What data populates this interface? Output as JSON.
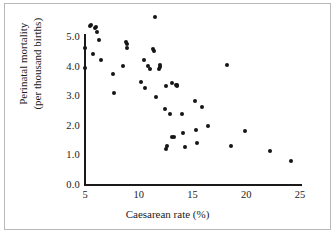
{
  "chart_data": {
    "type": "scatter",
    "title": "",
    "xlabel": "Caesarean rate (%)",
    "ylabel": "Perinatal mortality\n(per thousand births)",
    "ylabel_line1": "Perinatal mortality",
    "ylabel_line2": "(per thousand births)",
    "xlim": [
      5,
      25
    ],
    "ylim": [
      0.0,
      5.6
    ],
    "grid": false,
    "legend": null,
    "xticks": [
      5,
      10,
      15,
      20,
      25
    ],
    "xtick_labels": [
      "5",
      "10",
      "15",
      "20",
      "25"
    ],
    "yticks": [
      0.0,
      1.0,
      2.0,
      3.0,
      4.0,
      5.0
    ],
    "ytick_labels": [
      "0.0",
      "1.0",
      "2.0",
      "3.0",
      "4.0",
      "5.0"
    ],
    "marker_color": "#151515",
    "axis_color": "#1a1a1a",
    "background_color": "#ffffff",
    "frame_color": "#b8b8b8",
    "n_points": 52,
    "points": [
      {
        "x": 5.0,
        "y": 4.6
      },
      {
        "x": 5.0,
        "y": 3.92
      },
      {
        "x": 5.5,
        "y": 5.35
      },
      {
        "x": 5.6,
        "y": 5.38
      },
      {
        "x": 5.7,
        "y": 4.4
      },
      {
        "x": 5.9,
        "y": 5.28
      },
      {
        "x": 6.0,
        "y": 5.3
      },
      {
        "x": 6.1,
        "y": 5.12
      },
      {
        "x": 6.3,
        "y": 4.88
      },
      {
        "x": 6.5,
        "y": 4.2
      },
      {
        "x": 7.6,
        "y": 3.73
      },
      {
        "x": 7.7,
        "y": 3.08
      },
      {
        "x": 8.5,
        "y": 3.98
      },
      {
        "x": 8.8,
        "y": 4.8
      },
      {
        "x": 8.9,
        "y": 4.72
      },
      {
        "x": 8.9,
        "y": 4.6
      },
      {
        "x": 10.2,
        "y": 3.45
      },
      {
        "x": 10.5,
        "y": 4.18
      },
      {
        "x": 10.6,
        "y": 3.25
      },
      {
        "x": 10.9,
        "y": 4.0
      },
      {
        "x": 11.0,
        "y": 3.88
      },
      {
        "x": 11.3,
        "y": 4.55
      },
      {
        "x": 11.4,
        "y": 4.48
      },
      {
        "x": 11.5,
        "y": 5.65
      },
      {
        "x": 11.6,
        "y": 2.95
      },
      {
        "x": 11.9,
        "y": 3.9
      },
      {
        "x": 12.0,
        "y": 4.02
      },
      {
        "x": 12.0,
        "y": 3.95
      },
      {
        "x": 12.4,
        "y": 2.55
      },
      {
        "x": 12.5,
        "y": 3.32
      },
      {
        "x": 12.5,
        "y": 1.18
      },
      {
        "x": 12.6,
        "y": 1.3
      },
      {
        "x": 13.1,
        "y": 3.42
      },
      {
        "x": 13.3,
        "y": 1.58
      },
      {
        "x": 13.5,
        "y": 3.35
      },
      {
        "x": 13.6,
        "y": 3.35
      },
      {
        "x": 13.6,
        "y": 3.3
      },
      {
        "x": 13.1,
        "y": 1.6
      },
      {
        "x": 14.0,
        "y": 2.35
      },
      {
        "x": 14.1,
        "y": 1.72
      },
      {
        "x": 14.3,
        "y": 1.25
      },
      {
        "x": 15.2,
        "y": 2.82
      },
      {
        "x": 15.3,
        "y": 1.82
      },
      {
        "x": 15.4,
        "y": 1.38
      },
      {
        "x": 15.9,
        "y": 2.6
      },
      {
        "x": 16.4,
        "y": 1.95
      },
      {
        "x": 18.2,
        "y": 4.02
      },
      {
        "x": 18.6,
        "y": 1.28
      },
      {
        "x": 19.9,
        "y": 1.78
      },
      {
        "x": 22.2,
        "y": 1.12
      },
      {
        "x": 24.2,
        "y": 0.78
      },
      {
        "x": 12.9,
        "y": 2.38
      }
    ]
  }
}
